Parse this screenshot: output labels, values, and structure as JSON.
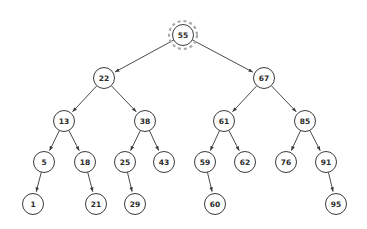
{
  "diagram": {
    "type": "binary-search-tree",
    "canvas": {
      "width": 367,
      "height": 229,
      "background": "#ffffff"
    },
    "style": {
      "node_fill": "#ffffff",
      "node_stroke": "#3b3b3b",
      "edge_color": "#4a4a4a",
      "label_color": "#2b2b2b",
      "highlight_color": "#a8a8a8",
      "node_radius": 10.5,
      "highlight_radius": 14
    },
    "highlighted_node": "55",
    "nodes": [
      {
        "id": "n55",
        "label": "55",
        "x": 183,
        "y": 35,
        "level": 0,
        "highlighted": true
      },
      {
        "id": "n22",
        "label": "22",
        "x": 104,
        "y": 78,
        "level": 1,
        "highlighted": false
      },
      {
        "id": "n67",
        "label": "67",
        "x": 264,
        "y": 78,
        "level": 1,
        "highlighted": false
      },
      {
        "id": "n13",
        "label": "13",
        "x": 64,
        "y": 121,
        "level": 2,
        "highlighted": false
      },
      {
        "id": "n38",
        "label": "38",
        "x": 145,
        "y": 121,
        "level": 2,
        "highlighted": false
      },
      {
        "id": "n61",
        "label": "61",
        "x": 224,
        "y": 121,
        "level": 2,
        "highlighted": false
      },
      {
        "id": "n85",
        "label": "85",
        "x": 305,
        "y": 121,
        "level": 2,
        "highlighted": false
      },
      {
        "id": "n5",
        "label": "5",
        "x": 44,
        "y": 162,
        "level": 3,
        "highlighted": false
      },
      {
        "id": "n18",
        "label": "18",
        "x": 85,
        "y": 162,
        "level": 3,
        "highlighted": false
      },
      {
        "id": "n25",
        "label": "25",
        "x": 125,
        "y": 162,
        "level": 3,
        "highlighted": false
      },
      {
        "id": "n43",
        "label": "43",
        "x": 164,
        "y": 162,
        "level": 3,
        "highlighted": false
      },
      {
        "id": "n59",
        "label": "59",
        "x": 205,
        "y": 162,
        "level": 3,
        "highlighted": false
      },
      {
        "id": "n62",
        "label": "62",
        "x": 245,
        "y": 162,
        "level": 3,
        "highlighted": false
      },
      {
        "id": "n76",
        "label": "76",
        "x": 286,
        "y": 162,
        "level": 3,
        "highlighted": false
      },
      {
        "id": "n91",
        "label": "91",
        "x": 326,
        "y": 162,
        "level": 3,
        "highlighted": false
      },
      {
        "id": "n1",
        "label": "1",
        "x": 33,
        "y": 204,
        "level": 4,
        "highlighted": false
      },
      {
        "id": "n21",
        "label": "21",
        "x": 96,
        "y": 204,
        "level": 4,
        "highlighted": false
      },
      {
        "id": "n29",
        "label": "29",
        "x": 135,
        "y": 204,
        "level": 4,
        "highlighted": false
      },
      {
        "id": "n60",
        "label": "60",
        "x": 215,
        "y": 204,
        "level": 4,
        "highlighted": false
      },
      {
        "id": "n95",
        "label": "95",
        "x": 336,
        "y": 204,
        "level": 4,
        "highlighted": false
      }
    ],
    "edges": [
      {
        "from": "n55",
        "to": "n22",
        "side": "left",
        "directed": true
      },
      {
        "from": "n55",
        "to": "n67",
        "side": "right",
        "directed": true
      },
      {
        "from": "n22",
        "to": "n13",
        "side": "left",
        "directed": true
      },
      {
        "from": "n22",
        "to": "n38",
        "side": "right",
        "directed": true
      },
      {
        "from": "n67",
        "to": "n61",
        "side": "left",
        "directed": true
      },
      {
        "from": "n67",
        "to": "n85",
        "side": "right",
        "directed": true
      },
      {
        "from": "n13",
        "to": "n5",
        "side": "left",
        "directed": true
      },
      {
        "from": "n13",
        "to": "n18",
        "side": "right",
        "directed": true
      },
      {
        "from": "n38",
        "to": "n25",
        "side": "left",
        "directed": true
      },
      {
        "from": "n38",
        "to": "n43",
        "side": "right",
        "directed": true
      },
      {
        "from": "n61",
        "to": "n59",
        "side": "left",
        "directed": true
      },
      {
        "from": "n61",
        "to": "n62",
        "side": "right",
        "directed": true
      },
      {
        "from": "n85",
        "to": "n76",
        "side": "left",
        "directed": true
      },
      {
        "from": "n85",
        "to": "n91",
        "side": "right",
        "directed": true
      },
      {
        "from": "n5",
        "to": "n1",
        "side": "left",
        "directed": true
      },
      {
        "from": "n18",
        "to": "n21",
        "side": "right",
        "directed": true
      },
      {
        "from": "n25",
        "to": "n29",
        "side": "right",
        "directed": true
      },
      {
        "from": "n59",
        "to": "n60",
        "side": "right",
        "directed": true
      },
      {
        "from": "n91",
        "to": "n95",
        "side": "right",
        "directed": true
      }
    ]
  }
}
